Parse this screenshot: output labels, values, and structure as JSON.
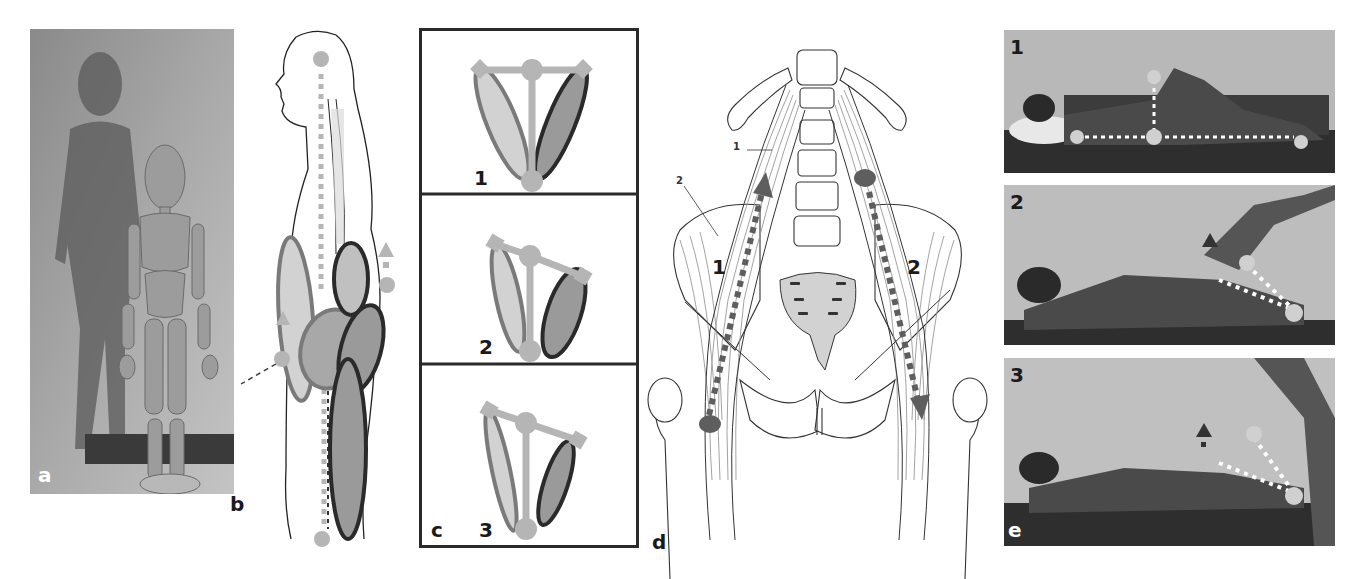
{
  "figure": {
    "panels": [
      {
        "id": "a",
        "label": "a",
        "description": "Photo of wooden articulated mannequin standing with shadow on wall"
      },
      {
        "id": "b",
        "label": "b",
        "description": "Lateral body outline with hip flexor/extensor muscle ellipses and dashed axis"
      },
      {
        "id": "c",
        "label": "c",
        "description": "Schematic pelvis balance diagrams",
        "sub_labels": [
          "1",
          "2",
          "3"
        ]
      },
      {
        "id": "d",
        "label": "d",
        "description": "Anterior view of lumbar spine and pelvis with psoas and iliacus muscles",
        "annotations": {
          "leader_1": "1",
          "leader_2": "2",
          "big_1": "1",
          "big_2": "2"
        }
      },
      {
        "id": "e",
        "label": "e",
        "description": "Photos of child lying supine during hip flexor tests",
        "sub_labels": [
          "1",
          "2",
          "3"
        ]
      }
    ]
  },
  "colors": {
    "marker_gray": "#b5b5b5",
    "muscle_light": "#d2d2d2",
    "muscle_dark": "#9a9a9a",
    "outline_dark": "#2a2a2a",
    "outline_mid": "#7a7a7a",
    "arrow_dark": "#5e5e5e",
    "photo_bg": "#a8a8a8"
  }
}
